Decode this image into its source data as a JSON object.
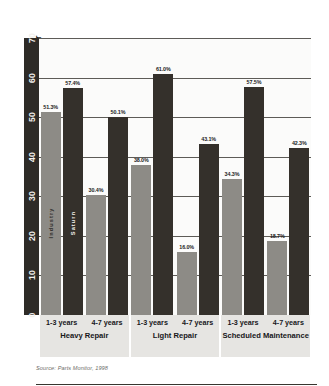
{
  "top_caption": "",
  "source_note": "Source: Parts Monitor, 1998",
  "series_names": {
    "industry": "Industry",
    "saturn": "Saturn"
  },
  "colors": {
    "industry_bar": "#8d8b86",
    "saturn_bar": "#34302b",
    "axis_band": "#2e2b27",
    "plot_background": "#fbfbfa",
    "category_band": "#e6e5e2",
    "gridline": "#5d5b57",
    "text": "#1c1c1c"
  },
  "chart_data": {
    "type": "bar",
    "title": "",
    "xlabel": "",
    "ylabel": "Percentage of Respondents Returning to Retailer",
    "ylim": [
      0,
      70
    ],
    "yticks": [
      0,
      10,
      20,
      30,
      40,
      50,
      60,
      70
    ],
    "grid": true,
    "legend_position": "in-bar",
    "categories": [
      "Heavy Repair / 1-3 years",
      "Heavy Repair / 4-7 years",
      "Light Repair / 1-3 years",
      "Light Repair / 4-7 years",
      "Scheduled Maintenance / 1-3 years",
      "Scheduled Maintenance / 4-7 years"
    ],
    "groups": [
      {
        "name": "Heavy Repair",
        "periods": [
          "1-3 years",
          "4-7 years"
        ]
      },
      {
        "name": "Light Repair",
        "periods": [
          "1-3 years",
          "4-7 years"
        ]
      },
      {
        "name": "Scheduled Maintenance",
        "periods": [
          "1-3 years",
          "4-7 years"
        ]
      }
    ],
    "series": [
      {
        "name": "Industry",
        "values": [
          51.3,
          30.4,
          38.0,
          16.0,
          34.3,
          18.7
        ]
      },
      {
        "name": "Saturn",
        "values": [
          57.4,
          50.1,
          61.0,
          43.1,
          57.5,
          42.3
        ]
      }
    ],
    "data_labels": [
      "51.3%",
      "57.4%",
      "30.4%",
      "50.1%",
      "38.0%",
      "61.0%",
      "16.0%",
      "43.1%",
      "34.3%",
      "57.5%",
      "18.7%",
      "42.3%"
    ]
  }
}
